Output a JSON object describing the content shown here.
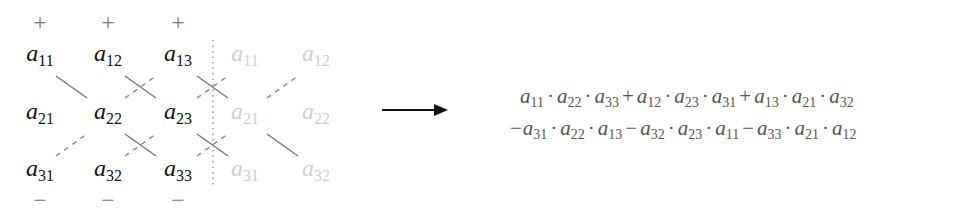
{
  "diagram": {
    "signs_top": [
      "+",
      "+",
      "+"
    ],
    "signs_bottom": [
      "−",
      "−",
      "−"
    ],
    "matrix": [
      [
        {
          "base": "a",
          "sub": "11"
        },
        {
          "base": "a",
          "sub": "12"
        },
        {
          "base": "a",
          "sub": "13"
        }
      ],
      [
        {
          "base": "a",
          "sub": "21"
        },
        {
          "base": "a",
          "sub": "22"
        },
        {
          "base": "a",
          "sub": "23"
        }
      ],
      [
        {
          "base": "a",
          "sub": "31"
        },
        {
          "base": "a",
          "sub": "32"
        },
        {
          "base": "a",
          "sub": "33"
        }
      ]
    ],
    "ghost_columns": [
      [
        {
          "base": "a",
          "sub": "11"
        },
        {
          "base": "a",
          "sub": "12"
        }
      ],
      [
        {
          "base": "a",
          "sub": "21"
        },
        {
          "base": "a",
          "sub": "22"
        }
      ],
      [
        {
          "base": "a",
          "sub": "31"
        },
        {
          "base": "a",
          "sub": "32"
        }
      ]
    ],
    "arrow": "right-arrow",
    "formula_line1": [
      {
        "sign": "",
        "terms": [
          "11",
          "22",
          "33"
        ]
      },
      {
        "sign": "+",
        "terms": [
          "12",
          "23",
          "31"
        ]
      },
      {
        "sign": "+",
        "terms": [
          "13",
          "21",
          "32"
        ]
      }
    ],
    "formula_line2": [
      {
        "sign": "−",
        "terms": [
          "31",
          "22",
          "13"
        ]
      },
      {
        "sign": "−",
        "terms": [
          "32",
          "23",
          "11"
        ]
      },
      {
        "sign": "−",
        "terms": [
          "33",
          "21",
          "12"
        ]
      }
    ],
    "colors": {
      "main_text": "#111111",
      "ghost_text": "#cfcfcf",
      "lines": "#777777",
      "formula": "#555555"
    }
  }
}
